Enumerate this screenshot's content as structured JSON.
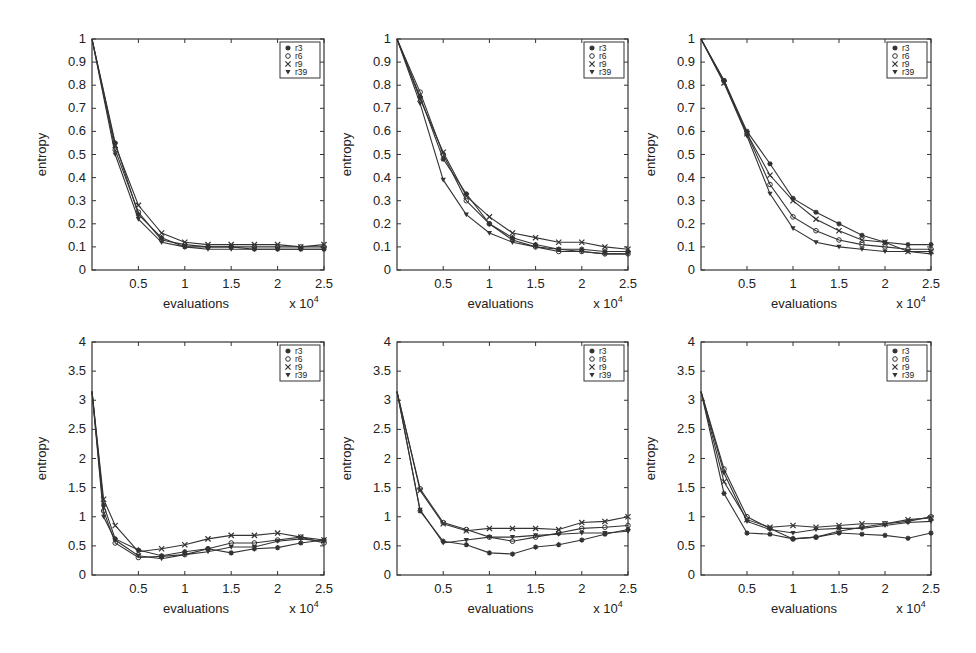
{
  "chart_data": [
    {
      "type": "line",
      "panel": "top-left",
      "xlabel": "evaluations",
      "x_multiplier": "x 10^4",
      "ylabel": "entropy",
      "xlim": [
        0,
        2.5
      ],
      "ylim": [
        0,
        1
      ],
      "xticks": [
        "0.5",
        "1",
        "1.5",
        "2",
        "2.5"
      ],
      "yticks": [
        "0",
        "0.1",
        "0.2",
        "0.3",
        "0.4",
        "0.5",
        "0.6",
        "0.7",
        "0.8",
        "0.9",
        "1"
      ],
      "legend": [
        "r3",
        "r6",
        "r9",
        "r39"
      ],
      "legend_position": "upper right",
      "x": [
        0,
        0.25,
        0.5,
        0.75,
        1.0,
        1.25,
        1.5,
        1.75,
        2.0,
        2.25,
        2.5
      ],
      "series": [
        {
          "name": "r3",
          "marker": "star",
          "values": [
            1,
            0.55,
            0.24,
            0.14,
            0.1,
            0.1,
            0.1,
            0.09,
            0.09,
            0.09,
            0.09
          ]
        },
        {
          "name": "r6",
          "marker": "circle",
          "values": [
            1,
            0.52,
            0.25,
            0.13,
            0.11,
            0.1,
            0.1,
            0.1,
            0.1,
            0.1,
            0.1
          ]
        },
        {
          "name": "r9",
          "marker": "x",
          "values": [
            1,
            0.54,
            0.28,
            0.16,
            0.12,
            0.11,
            0.11,
            0.11,
            0.11,
            0.1,
            0.11
          ]
        },
        {
          "name": "r39",
          "marker": "triangle",
          "values": [
            1,
            0.5,
            0.22,
            0.12,
            0.1,
            0.09,
            0.09,
            0.09,
            0.09,
            0.09,
            0.09
          ]
        }
      ]
    },
    {
      "type": "line",
      "panel": "top-middle",
      "xlabel": "evaluations",
      "x_multiplier": "x 10^4",
      "ylabel": "entropy",
      "xlim": [
        0,
        2.5
      ],
      "ylim": [
        0,
        1
      ],
      "xticks": [
        "0.5",
        "1",
        "1.5",
        "2",
        "2.5"
      ],
      "yticks": [
        "0",
        "0.1",
        "0.2",
        "0.3",
        "0.4",
        "0.5",
        "0.6",
        "0.7",
        "0.8",
        "0.9",
        "1"
      ],
      "legend": [
        "r3",
        "r6",
        "r9",
        "r39"
      ],
      "legend_position": "upper right",
      "x": [
        0,
        0.25,
        0.5,
        0.75,
        1.0,
        1.25,
        1.5,
        1.75,
        2.0,
        2.25,
        2.5
      ],
      "series": [
        {
          "name": "r3",
          "marker": "star",
          "values": [
            1,
            0.75,
            0.48,
            0.33,
            0.2,
            0.14,
            0.11,
            0.09,
            0.09,
            0.08,
            0.08
          ]
        },
        {
          "name": "r6",
          "marker": "circle",
          "values": [
            1,
            0.77,
            0.5,
            0.3,
            0.2,
            0.13,
            0.1,
            0.08,
            0.08,
            0.07,
            0.07
          ]
        },
        {
          "name": "r9",
          "marker": "x",
          "values": [
            1,
            0.74,
            0.51,
            0.32,
            0.23,
            0.16,
            0.14,
            0.12,
            0.12,
            0.1,
            0.09
          ]
        },
        {
          "name": "r39",
          "marker": "triangle",
          "values": [
            1,
            0.72,
            0.39,
            0.24,
            0.16,
            0.12,
            0.1,
            0.09,
            0.08,
            0.07,
            0.07
          ]
        }
      ]
    },
    {
      "type": "line",
      "panel": "top-right",
      "xlabel": "evaluations",
      "x_multiplier": "x 10^4",
      "ylabel": "entropy",
      "xlim": [
        0,
        2.5
      ],
      "ylim": [
        0,
        1
      ],
      "xticks": [
        "0.5",
        "1",
        "1.5",
        "2",
        "2.5"
      ],
      "yticks": [
        "0",
        "0.1",
        "0.2",
        "0.3",
        "0.4",
        "0.5",
        "0.6",
        "0.7",
        "0.8",
        "0.9",
        "1"
      ],
      "legend": [
        "r3",
        "r6",
        "r9",
        "r39"
      ],
      "legend_position": "upper right",
      "x": [
        0,
        0.25,
        0.5,
        0.75,
        1.0,
        1.25,
        1.5,
        1.75,
        2.0,
        2.25,
        2.5
      ],
      "series": [
        {
          "name": "r3",
          "marker": "star",
          "values": [
            1,
            0.82,
            0.6,
            0.46,
            0.31,
            0.25,
            0.2,
            0.15,
            0.12,
            0.11,
            0.11
          ]
        },
        {
          "name": "r6",
          "marker": "circle",
          "values": [
            1,
            0.82,
            0.59,
            0.37,
            0.23,
            0.17,
            0.13,
            0.11,
            0.1,
            0.09,
            0.09
          ]
        },
        {
          "name": "r9",
          "marker": "x",
          "values": [
            1,
            0.81,
            0.59,
            0.41,
            0.3,
            0.22,
            0.17,
            0.13,
            0.12,
            0.08,
            0.08
          ]
        },
        {
          "name": "r39",
          "marker": "triangle",
          "values": [
            1,
            0.81,
            0.58,
            0.33,
            0.18,
            0.12,
            0.1,
            0.09,
            0.08,
            0.08,
            0.07
          ]
        }
      ]
    },
    {
      "type": "line",
      "panel": "bottom-left",
      "xlabel": "evaluations",
      "x_multiplier": "x 10^4",
      "ylabel": "entropy",
      "xlim": [
        0,
        2.5
      ],
      "ylim": [
        0,
        4
      ],
      "xticks": [
        "0.5",
        "1",
        "1.5",
        "2",
        "2.5"
      ],
      "yticks": [
        "0",
        "0.5",
        "1",
        "1.5",
        "2",
        "2.5",
        "3",
        "3.5",
        "4"
      ],
      "legend": [
        "r3",
        "r6",
        "r9",
        "r39"
      ],
      "legend_position": "upper right",
      "x": [
        0,
        0.125,
        0.25,
        0.5,
        0.75,
        1.0,
        1.25,
        1.5,
        1.75,
        2.0,
        2.25,
        2.5
      ],
      "series": [
        {
          "name": "r3",
          "marker": "star",
          "values": [
            3.15,
            1.2,
            0.62,
            0.43,
            0.33,
            0.4,
            0.45,
            0.38,
            0.45,
            0.47,
            0.55,
            0.6
          ]
        },
        {
          "name": "r6",
          "marker": "circle",
          "values": [
            3.15,
            1.1,
            0.55,
            0.3,
            0.32,
            0.35,
            0.45,
            0.55,
            0.55,
            0.6,
            0.65,
            0.55
          ]
        },
        {
          "name": "r9",
          "marker": "x",
          "values": [
            3.15,
            1.3,
            0.85,
            0.4,
            0.45,
            0.52,
            0.62,
            0.68,
            0.68,
            0.72,
            0.65,
            0.6
          ]
        },
        {
          "name": "r39",
          "marker": "triangle",
          "values": [
            3.15,
            1.0,
            0.6,
            0.33,
            0.28,
            0.35,
            0.4,
            0.48,
            0.48,
            0.58,
            0.62,
            0.58
          ]
        }
      ]
    },
    {
      "type": "line",
      "panel": "bottom-middle",
      "xlabel": "evaluations",
      "x_multiplier": "x 10^4",
      "ylabel": "entropy",
      "xlim": [
        0,
        2.5
      ],
      "ylim": [
        0,
        4
      ],
      "xticks": [
        "0.5",
        "1",
        "1.5",
        "2",
        "2.5"
      ],
      "yticks": [
        "0",
        "0.5",
        "1",
        "1.5",
        "2",
        "2.5",
        "3",
        "3.5",
        "4"
      ],
      "legend": [
        "r3",
        "r6",
        "r9",
        "r39"
      ],
      "legend_position": "upper right",
      "x": [
        0,
        0.25,
        0.5,
        0.75,
        1.0,
        1.25,
        1.5,
        1.75,
        2.0,
        2.25,
        2.5
      ],
      "series": [
        {
          "name": "r3",
          "marker": "star",
          "values": [
            3.15,
            1.1,
            0.58,
            0.52,
            0.38,
            0.36,
            0.48,
            0.52,
            0.6,
            0.7,
            0.78
          ]
        },
        {
          "name": "r6",
          "marker": "circle",
          "values": [
            3.15,
            1.48,
            0.9,
            0.78,
            0.65,
            0.58,
            0.65,
            0.72,
            0.8,
            0.82,
            0.85
          ]
        },
        {
          "name": "r9",
          "marker": "x",
          "values": [
            3.15,
            1.45,
            0.88,
            0.76,
            0.8,
            0.8,
            0.8,
            0.78,
            0.9,
            0.92,
            1.0
          ]
        },
        {
          "name": "r39",
          "marker": "triangle",
          "values": [
            3.15,
            1.12,
            0.55,
            0.6,
            0.65,
            0.65,
            0.68,
            0.7,
            0.72,
            0.72,
            0.75
          ]
        }
      ]
    },
    {
      "type": "line",
      "panel": "bottom-right",
      "xlabel": "evaluations",
      "x_multiplier": "x 10^4",
      "ylabel": "entropy",
      "xlim": [
        0,
        2.5
      ],
      "ylim": [
        0,
        4
      ],
      "xticks": [
        "0.5",
        "1",
        "1.5",
        "2",
        "2.5"
      ],
      "yticks": [
        "0",
        "0.5",
        "1",
        "1.5",
        "2",
        "2.5",
        "3",
        "3.5",
        "4"
      ],
      "legend": [
        "r3",
        "r6",
        "r9",
        "r39"
      ],
      "legend_position": "upper right",
      "x": [
        0,
        0.25,
        0.5,
        0.75,
        1.0,
        1.25,
        1.5,
        1.75,
        2.0,
        2.25,
        2.5
      ],
      "series": [
        {
          "name": "r3",
          "marker": "star",
          "values": [
            3.15,
            1.4,
            0.72,
            0.7,
            0.62,
            0.65,
            0.72,
            0.7,
            0.68,
            0.63,
            0.72
          ]
        },
        {
          "name": "r6",
          "marker": "circle",
          "values": [
            3.15,
            1.82,
            1.0,
            0.8,
            0.62,
            0.65,
            0.75,
            0.82,
            0.88,
            0.92,
            1.0
          ]
        },
        {
          "name": "r9",
          "marker": "x",
          "values": [
            3.15,
            1.6,
            0.95,
            0.82,
            0.85,
            0.82,
            0.85,
            0.88,
            0.88,
            0.95,
            0.98
          ]
        },
        {
          "name": "r39",
          "marker": "triangle",
          "values": [
            3.15,
            1.75,
            0.92,
            0.78,
            0.72,
            0.78,
            0.8,
            0.8,
            0.85,
            0.9,
            0.92
          ]
        }
      ]
    }
  ],
  "layout": {
    "panels": [
      {
        "left": 92,
        "top": 39,
        "right": 324,
        "bottom": 270
      },
      {
        "left": 397,
        "top": 39,
        "right": 628,
        "bottom": 270
      },
      {
        "left": 701,
        "top": 39,
        "right": 931,
        "bottom": 270
      },
      {
        "left": 92,
        "top": 342,
        "right": 324,
        "bottom": 575
      },
      {
        "left": 397,
        "top": 342,
        "right": 628,
        "bottom": 575
      },
      {
        "left": 701,
        "top": 342,
        "right": 931,
        "bottom": 575
      }
    ],
    "line_color": "#333333",
    "axis_color": "#333333"
  }
}
